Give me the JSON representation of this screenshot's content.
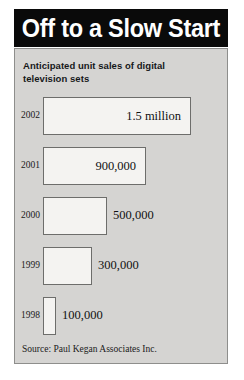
{
  "figure": {
    "title": "Off to a Slow Start",
    "subtitle": "Anticipated unit sales of digital television sets",
    "source": "Source: Paul Kegan Associates Inc.",
    "colors": {
      "banner_bg": "#0a0a0a",
      "banner_text": "#ffffff",
      "panel_bg": "#d5d4d2",
      "panel_border": "#8e8e8c",
      "bar_fill": "#f4f3f1",
      "bar_border": "#6d6d6b",
      "text": "#111111"
    }
  },
  "chart_data": {
    "type": "bar",
    "orientation": "horizontal",
    "title": "Off to a Slow Start",
    "subtitle": "Anticipated unit sales of digital television sets",
    "xlabel": "",
    "ylabel": "",
    "grid": false,
    "legend": null,
    "source": "Source: Paul Kegan Associates Inc.",
    "categories": [
      "2002",
      "2001",
      "2000",
      "1999",
      "1998"
    ],
    "values": [
      1500000,
      900000,
      500000,
      300000,
      100000
    ],
    "data_labels": [
      "1.5 million",
      "900,000",
      "500,000",
      "300,000",
      "100,000"
    ],
    "label_placement": [
      "inside",
      "inside",
      "outside",
      "outside",
      "outside"
    ],
    "xlim": [
      0,
      1500000
    ],
    "bars": [
      {
        "category": "2002",
        "value": 1500000,
        "label": "1.5 million",
        "placement": "inside",
        "width_px": 148,
        "height_px": 38
      },
      {
        "category": "2001",
        "value": 900000,
        "label": "900,000",
        "placement": "inside",
        "width_px": 103,
        "height_px": 38
      },
      {
        "category": "2000",
        "value": 500000,
        "label": "500,000",
        "placement": "outside",
        "width_px": 64,
        "height_px": 38
      },
      {
        "category": "1999",
        "value": 300000,
        "label": "300,000",
        "placement": "outside",
        "width_px": 49,
        "height_px": 38
      },
      {
        "category": "1998",
        "value": 100000,
        "label": "100,000",
        "placement": "outside",
        "width_px": 13,
        "height_px": 38
      }
    ]
  }
}
